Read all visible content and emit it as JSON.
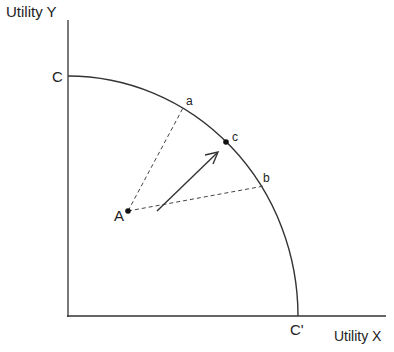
{
  "diagram": {
    "axes": {
      "y_label": "Utility Y",
      "x_label": "Utility X"
    },
    "frontier": {
      "y_intercept_label": "C",
      "x_intercept_label": "C'"
    },
    "points": {
      "A": "A",
      "a": "a",
      "b": "b",
      "c": "c"
    }
  },
  "colors": {
    "line": "#333333",
    "background": "#ffffff"
  }
}
